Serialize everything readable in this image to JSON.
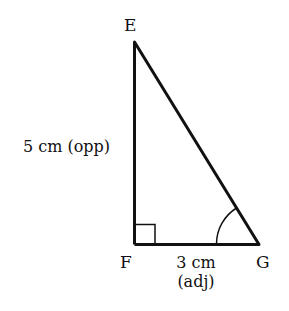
{
  "diagram": {
    "type": "right-triangle",
    "vertices": {
      "E": {
        "label": "E"
      },
      "F": {
        "label": "F"
      },
      "G": {
        "label": "G"
      }
    },
    "sides": {
      "EF": {
        "length": "5 cm",
        "role": "(opp)",
        "text": "5 cm (opp)"
      },
      "FG": {
        "length": "3 cm",
        "role": "(adj)",
        "text_line1": "3 cm",
        "text_line2": "(adj)"
      }
    },
    "right_angle_at": "F",
    "marked_angle_at": "G",
    "colors": {
      "stroke": "#111111",
      "background": "#ffffff"
    }
  }
}
